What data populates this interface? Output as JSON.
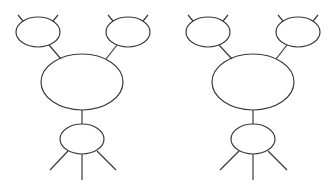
{
  "diagram": {
    "stroke_color": "#3a3a3a",
    "background": "#ffffff",
    "figures": [
      {
        "id": "left",
        "top_left_node": {
          "cx": 38,
          "cy": 32,
          "rx": 22,
          "ry": 15
        },
        "top_right_node": {
          "cx": 128,
          "cy": 32,
          "rx": 22,
          "ry": 15
        },
        "center_node": {
          "cx": 82,
          "cy": 82,
          "rx": 41,
          "ry": 28
        },
        "bottom_node": {
          "cx": 82,
          "cy": 139,
          "rx": 22,
          "ry": 15
        }
      },
      {
        "id": "right",
        "top_left_node": {
          "cx": 208,
          "cy": 32,
          "rx": 22,
          "ry": 15
        },
        "top_right_node": {
          "cx": 298,
          "cy": 32,
          "rx": 22,
          "ry": 15
        },
        "center_node": {
          "cx": 253,
          "cy": 82,
          "rx": 41,
          "ry": 28
        },
        "bottom_node": {
          "cx": 253,
          "cy": 139,
          "rx": 22,
          "ry": 15
        }
      }
    ]
  }
}
